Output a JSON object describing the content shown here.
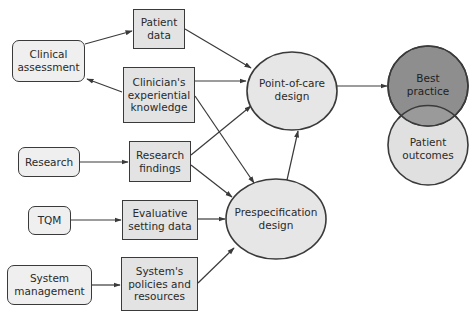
{
  "diagram": {
    "colors": {
      "line": "#3a3a3a",
      "source_fill": "#efefef",
      "box_fill": "#e3e3e3",
      "design_fill": "#e6e6e6",
      "best_practice_fill": "#8e8e8e",
      "patient_outcomes_fill": "#e0e0e0",
      "overlap_fill": "#9a9a9a"
    },
    "sources": {
      "clinical_assessment": "Clinical\nassessment",
      "research": "Research",
      "tqm": "TQM",
      "system_management": "System\nmanagement"
    },
    "inputs": {
      "patient_data": "Patient\ndata",
      "clinicians_knowledge": "Clinician's\nexperiential\nknowledge",
      "research_findings": "Research\nfindings",
      "evaluative_setting_data": "Evaluative\nsetting data",
      "systems_policies": "System's\npolicies and\nresources"
    },
    "designs": {
      "point_of_care": "Point-of-care\ndesign",
      "prespecification": "Prespecification\ndesign"
    },
    "outcomes": {
      "best_practice": "Best\npractice",
      "patient_outcomes": "Patient\noutcomes"
    },
    "edges": [
      {
        "from": "Clinical assessment",
        "to": "Patient data"
      },
      {
        "from": "Clinician's experiential knowledge",
        "to": "Clinical assessment"
      },
      {
        "from": "Research",
        "to": "Research findings"
      },
      {
        "from": "TQM",
        "to": "Evaluative setting data"
      },
      {
        "from": "System management",
        "to": "System's policies and resources"
      },
      {
        "from": "Patient data",
        "to": "Point-of-care design"
      },
      {
        "from": "Clinician's experiential knowledge",
        "to": "Point-of-care design"
      },
      {
        "from": "Research findings",
        "to": "Point-of-care design"
      },
      {
        "from": "Clinician's experiential knowledge",
        "to": "Prespecification design"
      },
      {
        "from": "Research findings",
        "to": "Prespecification design"
      },
      {
        "from": "Evaluative setting data",
        "to": "Prespecification design"
      },
      {
        "from": "System's policies and resources",
        "to": "Prespecification design"
      },
      {
        "from": "Prespecification design",
        "to": "Point-of-care design"
      },
      {
        "from": "Point-of-care design",
        "to": "Best practice"
      }
    ]
  }
}
